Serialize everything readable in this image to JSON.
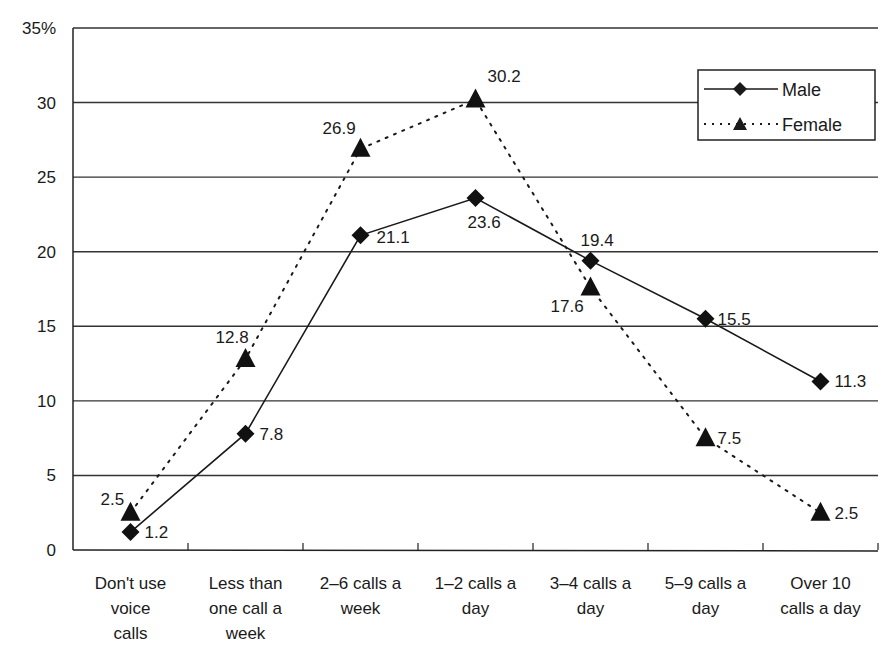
{
  "chart_data": {
    "type": "line",
    "title": "",
    "xlabel": "",
    "ylabel": "",
    "y_unit": "%",
    "ylim": [
      0,
      35
    ],
    "yticks": [
      "0",
      "5",
      "10",
      "15",
      "20",
      "25",
      "30",
      "35%"
    ],
    "grid": "horizontal",
    "legend_position": "top-right inside",
    "categories": [
      [
        "Don't use",
        "voice",
        "calls"
      ],
      [
        "Less than",
        "one call a",
        "week"
      ],
      [
        "2–6 calls a",
        "week"
      ],
      [
        "1–2 calls a",
        "day"
      ],
      [
        "3–4 calls a",
        "day"
      ],
      [
        "5–9 calls a",
        "day"
      ],
      [
        "Over 10",
        "calls a day"
      ]
    ],
    "series": [
      {
        "name": "Male",
        "marker": "diamond",
        "line": "solid",
        "values": [
          1.2,
          7.8,
          21.1,
          23.6,
          19.4,
          15.5,
          11.3
        ],
        "labels": [
          "1.2",
          "7.8",
          "21.1",
          "23.6",
          "19.4",
          "15.5",
          "11.3"
        ]
      },
      {
        "name": "Female",
        "marker": "triangle",
        "line": "dotted",
        "values": [
          2.5,
          12.8,
          26.9,
          30.2,
          17.6,
          7.5,
          2.5
        ],
        "labels": [
          "2.5",
          "12.8",
          "26.9",
          "30.2",
          "17.6",
          "7.5",
          "2.5"
        ]
      }
    ]
  },
  "legend": {
    "male": "Male",
    "female": "Female"
  },
  "colors": {
    "line": "#1a1a1a",
    "grid": "#333333",
    "background": "#ffffff"
  }
}
